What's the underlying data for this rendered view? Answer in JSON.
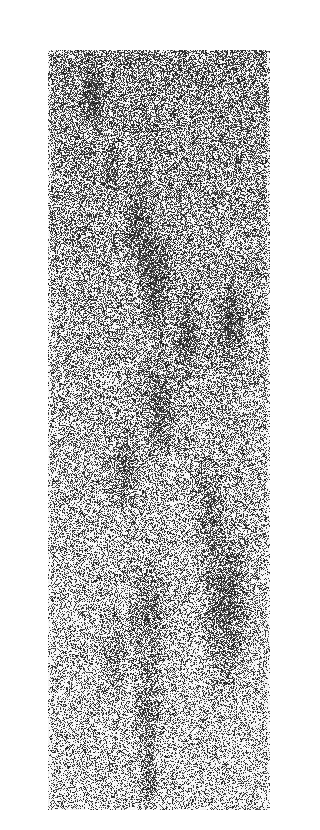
{
  "image": {
    "description": "Grainy dithered grayscale vertical strip with darker blotchy masses running diagonally through the middle; grayer at top, lighter toward bottom",
    "colors": {
      "background": "#ffffff",
      "ink": "#111111",
      "paper": "#ffffff"
    },
    "tone": {
      "top_density": 0.55,
      "bottom_density": 0.28
    },
    "blobs": [
      {
        "u": 0.2,
        "v": 0.06,
        "r": 0.06,
        "d": 0.45
      },
      {
        "u": 0.28,
        "v": 0.16,
        "r": 0.05,
        "d": 0.35
      },
      {
        "u": 0.4,
        "v": 0.23,
        "r": 0.08,
        "d": 0.45
      },
      {
        "u": 0.48,
        "v": 0.3,
        "r": 0.09,
        "d": 0.5
      },
      {
        "u": 0.82,
        "v": 0.36,
        "r": 0.08,
        "d": 0.5
      },
      {
        "u": 0.62,
        "v": 0.38,
        "r": 0.08,
        "d": 0.45
      },
      {
        "u": 0.5,
        "v": 0.47,
        "r": 0.09,
        "d": 0.5
      },
      {
        "u": 0.35,
        "v": 0.55,
        "r": 0.07,
        "d": 0.45
      },
      {
        "u": 0.72,
        "v": 0.6,
        "r": 0.08,
        "d": 0.4
      },
      {
        "u": 0.8,
        "v": 0.73,
        "r": 0.13,
        "d": 0.55
      },
      {
        "u": 0.45,
        "v": 0.74,
        "r": 0.1,
        "d": 0.45
      },
      {
        "u": 0.3,
        "v": 0.8,
        "r": 0.07,
        "d": 0.4
      },
      {
        "u": 0.45,
        "v": 0.87,
        "r": 0.08,
        "d": 0.45
      },
      {
        "u": 0.45,
        "v": 0.96,
        "r": 0.05,
        "d": 0.5
      }
    ]
  }
}
